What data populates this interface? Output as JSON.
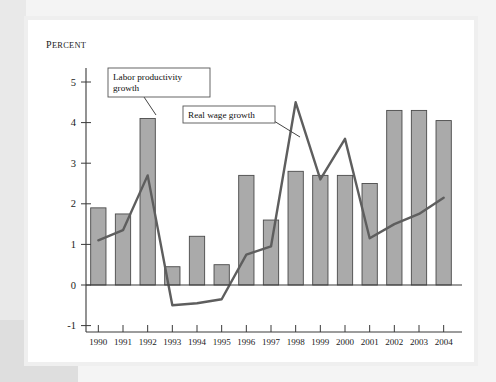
{
  "figure": {
    "background_color": "#ffffff",
    "frame_color": "#efefef"
  },
  "axis": {
    "y_unit_label": "Percent",
    "y_ticks": [
      "5",
      "4",
      "3",
      "2",
      "1",
      "0",
      "-1"
    ],
    "x_ticks": [
      "1990",
      "1991",
      "1992",
      "1993",
      "1994",
      "1995",
      "1996",
      "1997",
      "1998",
      "1999",
      "2000",
      "2001",
      "2002",
      "2003",
      "2004"
    ]
  },
  "annotations": [
    {
      "id": "labor-productivity",
      "line1": "Labor productivity",
      "line2": "growth"
    },
    {
      "id": "real-wage",
      "line1": "Real wage growth",
      "line2": ""
    }
  ],
  "colors": {
    "bar_fill": "#aaaaaa",
    "bar_stroke": "#4a4a4a",
    "line_stroke": "#5e5e5e",
    "axis": "#3a3a3a"
  },
  "chart_data": {
    "type": "bar",
    "title": "",
    "subtitle": "",
    "xlabel": "",
    "ylabel": "Percent",
    "ylim": [
      -1,
      5.5
    ],
    "yticks": [
      -1,
      0,
      1,
      2,
      3,
      4,
      5
    ],
    "grid": false,
    "legend_position": "annotations",
    "categories": [
      "1990",
      "1991",
      "1992",
      "1993",
      "1994",
      "1995",
      "1996",
      "1997",
      "1998",
      "1999",
      "2000",
      "2001",
      "2002",
      "2003",
      "2004"
    ],
    "series": [
      {
        "name": "Labor productivity growth",
        "type": "bar",
        "values": [
          1.9,
          1.75,
          4.1,
          0.45,
          1.2,
          0.5,
          2.7,
          1.6,
          2.8,
          2.7,
          2.7,
          2.5,
          4.3,
          4.3,
          4.05
        ]
      },
      {
        "name": "Real wage growth",
        "type": "line",
        "values": [
          1.1,
          1.35,
          2.7,
          -0.5,
          -0.45,
          -0.35,
          0.75,
          0.95,
          4.5,
          2.6,
          3.6,
          1.15,
          1.5,
          1.75,
          2.15
        ]
      }
    ]
  }
}
